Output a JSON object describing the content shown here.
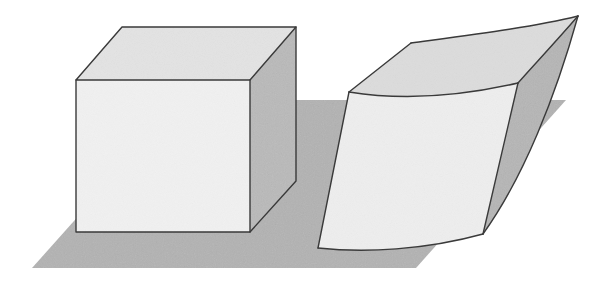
{
  "figure": {
    "title": "Cube and deformed cube resting on a ground plane",
    "background_color": "#ffffff",
    "width": 616,
    "height": 289,
    "style": "grayscale line drawing with flat shaded faces and paper grain texture"
  },
  "palette": {
    "background": "#ffffff",
    "ground_fill": "#b2b2b2",
    "front_face_fill": "#f1f1f1",
    "top_face_fill": "#e3e3e3",
    "side_face_fill": "#b9b9b9",
    "warped_top_fill": "#dcdcdc",
    "warped_front_fill": "#eeeeee",
    "warped_side_fill": "#b5b5b5",
    "outline": "#3a3a3a"
  },
  "ground_plane": {
    "label": "ground plane",
    "shape": "parallelogram",
    "fill": "#b2b2b2",
    "points": "32,268 182,100 566,100 416,268"
  },
  "objects": [
    {
      "id": "cube",
      "label": "Undeformed cube",
      "description": "Axonometric cube with flat square front face, parallelogram top face and parallelogram right face",
      "faces": [
        {
          "name": "front-face",
          "fill": "#f1f1f1",
          "points": "76,80 250,80 250,232 76,232"
        },
        {
          "name": "top-face",
          "fill": "#e3e3e3",
          "points": "76,80 122,27 296,27 250,80"
        },
        {
          "name": "right-face",
          "fill": "#b9b9b9",
          "points": "250,80 296,27 296,181 250,232"
        }
      ]
    },
    {
      "id": "deformed-cube",
      "label": "Deformed (warped) cube",
      "description": "Cube bent and sheared so that its top face sweeps upward to the right into a point and its vertical edges curve",
      "faces": [
        {
          "name": "warped-front-face",
          "fill": "#eeeeee",
          "path": "M 349,92 C 405,101 466,95 518,83 L 483,234 C 425,250 365,253 318,248 Z"
        },
        {
          "name": "warped-top-face",
          "fill": "#dcdcdc",
          "path": "M 349,92 L 411,43 C 470,35 534,27 578,16 C 552,46 531,68 518,83 C 466,95 405,101 349,92 Z"
        },
        {
          "name": "warped-right-face",
          "fill": "#b5b5b5",
          "path": "M 518,83 L 578,16 C 556,95 524,177 483,234 Z"
        }
      ]
    }
  ],
  "edges": {
    "outline_color": "#3a3a3a",
    "outline_width": 1.4
  }
}
